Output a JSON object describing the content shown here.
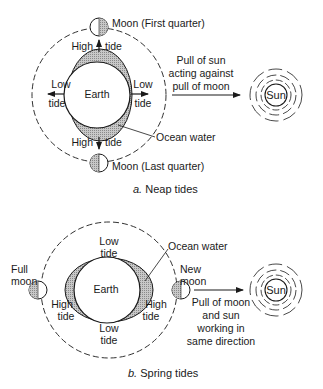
{
  "diagram": {
    "neap": {
      "caption_letter": "a.",
      "caption_text": " Neap tides",
      "earth_label": "Earth",
      "moon_top_label": "Moon (First quarter)",
      "moon_bottom_label": "Moon (Last quarter)",
      "high_tide_top": [
        "High",
        "tide"
      ],
      "high_tide_bottom": [
        "High",
        "tide"
      ],
      "low_tide_left": [
        "Low",
        "tide"
      ],
      "low_tide_right": [
        "Low",
        "tide"
      ],
      "ocean_label": "Ocean water",
      "pull_text": [
        "Pull of sun",
        "acting against",
        "pull of moon"
      ],
      "sun_label": "Sun"
    },
    "spring": {
      "caption_letter": "b.",
      "caption_text": " Spring tides",
      "earth_label": "Earth",
      "full_moon_label": [
        "Full",
        "moon"
      ],
      "new_moon_label": [
        "New",
        "moon"
      ],
      "low_tide_top": [
        "Low",
        "tide"
      ],
      "low_tide_bottom": [
        "Low",
        "tide"
      ],
      "high_tide_left": [
        "High",
        "tide"
      ],
      "high_tide_right": [
        "High",
        "tide"
      ],
      "ocean_label": "Ocean water",
      "pull_text": [
        "Pull of moon",
        "and sun",
        "working in",
        "same direction"
      ],
      "sun_label": "Sun"
    },
    "colors": {
      "line": "#1a1a1a",
      "hatch": "#9a9a9a",
      "background": "#ffffff"
    }
  }
}
